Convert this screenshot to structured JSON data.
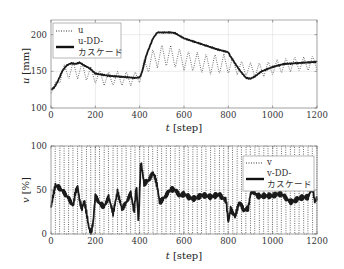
{
  "chart_data": [
    {
      "type": "line",
      "title": "",
      "xlabel": "t [step]",
      "ylabel": "u [mm]",
      "xlim": [
        0,
        1200
      ],
      "ylim": [
        100,
        220
      ],
      "xticks": [
        0,
        200,
        400,
        600,
        800,
        1000,
        1200
      ],
      "yticks": [
        100,
        150,
        200
      ],
      "grid": true,
      "legend_position": "upper left",
      "series": [
        {
          "name": "u",
          "style": "dotted",
          "oscillating": true,
          "x": [
            0,
            20,
            50,
            100,
            150,
            200,
            250,
            300,
            350,
            390,
            410,
            450,
            500,
            550,
            600,
            650,
            700,
            750,
            800,
            820,
            850,
            900,
            950,
            1000,
            1050,
            1100,
            1150,
            1200
          ],
          "y": [
            122,
            130,
            148,
            152,
            150,
            143,
            140,
            140,
            140,
            140,
            150,
            165,
            172,
            170,
            165,
            163,
            160,
            160,
            160,
            158,
            155,
            152,
            152,
            155,
            158,
            160,
            160,
            162
          ],
          "amplitude": [
            2,
            6,
            10,
            12,
            12,
            10,
            10,
            10,
            10,
            10,
            12,
            14,
            15,
            15,
            14,
            14,
            14,
            14,
            14,
            12,
            10,
            10,
            10,
            10,
            10,
            10,
            10,
            10
          ]
        },
        {
          "name": "u-DD-カスケード",
          "style": "solid",
          "x": [
            0,
            15,
            30,
            50,
            70,
            90,
            110,
            130,
            150,
            170,
            190,
            200,
            220,
            260,
            300,
            340,
            380,
            400,
            410,
            430,
            460,
            480,
            540,
            560,
            600,
            650,
            700,
            750,
            800,
            810,
            850,
            880,
            900,
            920,
            950,
            1000,
            1050,
            1100,
            1150,
            1200
          ],
          "y": [
            125,
            128,
            136,
            150,
            158,
            161,
            160,
            162,
            158,
            155,
            150,
            147,
            146,
            144,
            143,
            142,
            141,
            142,
            148,
            172,
            195,
            203,
            203,
            202,
            195,
            190,
            185,
            180,
            176,
            170,
            152,
            141,
            140,
            143,
            150,
            156,
            160,
            161,
            162,
            163
          ]
        }
      ]
    },
    {
      "type": "line",
      "title": "",
      "xlabel": "t [step]",
      "ylabel": "v [%]",
      "xlim": [
        0,
        1200
      ],
      "ylim": [
        0,
        100
      ],
      "xticks": [
        0,
        200,
        400,
        600,
        800,
        1000,
        1200
      ],
      "yticks": [
        0,
        50,
        100
      ],
      "grid": true,
      "legend_position": "upper right",
      "series": [
        {
          "name": "v",
          "style": "dotted",
          "description": "saturating switching signal between 0 and 100 with period ~40 steps",
          "period": 40,
          "min": 0,
          "max": 100
        },
        {
          "name": "v-DD-カスケード",
          "style": "solid",
          "x": [
            0,
            10,
            20,
            40,
            60,
            80,
            100,
            110,
            120,
            130,
            140,
            150,
            160,
            170,
            180,
            190,
            200,
            220,
            240,
            260,
            280,
            300,
            320,
            340,
            360,
            375,
            385,
            395,
            405,
            420,
            440,
            460,
            470,
            480,
            490,
            500,
            520,
            540,
            560,
            580,
            600,
            640,
            680,
            720,
            760,
            790,
            800,
            810,
            830,
            850,
            870,
            890,
            900,
            910,
            930,
            960,
            1000,
            1040,
            1080,
            1120,
            1160,
            1180,
            1190,
            1200
          ],
          "y": [
            30,
            45,
            57,
            54,
            48,
            40,
            30,
            45,
            52,
            35,
            28,
            38,
            25,
            10,
            2,
            15,
            45,
            35,
            30,
            40,
            22,
            48,
            30,
            38,
            48,
            25,
            55,
            12,
            82,
            55,
            60,
            70,
            65,
            55,
            38,
            40,
            45,
            50,
            48,
            42,
            45,
            42,
            44,
            40,
            45,
            40,
            15,
            30,
            20,
            35,
            25,
            28,
            45,
            50,
            45,
            45,
            42,
            44,
            38,
            42,
            40,
            52,
            35,
            40
          ]
        }
      ]
    }
  ],
  "plots": {
    "top": {
      "ylabel_var": "u",
      "ylabel_unit": "[mm]",
      "xlabel_var": "t",
      "xlabel_unit": "[step]",
      "legend": [
        "u",
        "u-DD-",
        "カスケード"
      ]
    },
    "bottom": {
      "ylabel_var": "v",
      "ylabel_unit": "[%]",
      "xlabel_var": "t",
      "xlabel_unit": "[step]",
      "legend": [
        "v",
        "v-DD-",
        "カスケード"
      ]
    }
  },
  "colors": {
    "line": "#1a1a1a",
    "dotted": "#333333",
    "grid": "#d8d8d8",
    "frame": "#888888"
  }
}
